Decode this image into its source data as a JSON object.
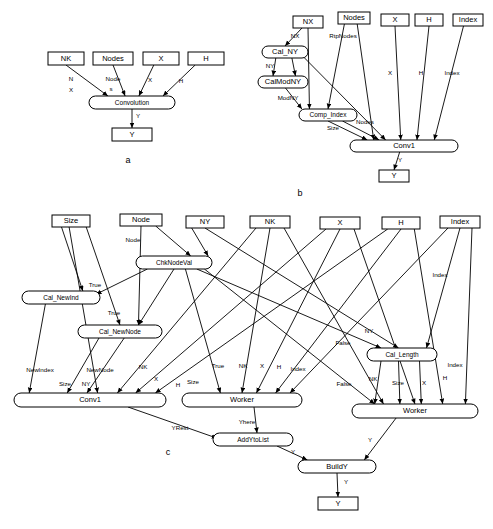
{
  "figure": {
    "panels": [
      {
        "id": "a",
        "letter": "a",
        "nodes": [
          {
            "name": "nk-box",
            "label": "NK",
            "shape": "rect",
            "x": 48,
            "y": 52,
            "w": 36,
            "h": 13
          },
          {
            "name": "nodes-box",
            "label": "Nodes",
            "shape": "rect",
            "x": 93,
            "y": 52,
            "w": 40,
            "h": 13
          },
          {
            "name": "x-box",
            "label": "X",
            "shape": "rect",
            "x": 143,
            "y": 52,
            "w": 36,
            "h": 13
          },
          {
            "name": "h-box",
            "label": "H",
            "shape": "rect",
            "x": 188,
            "y": 52,
            "w": 36,
            "h": 13
          },
          {
            "name": "convolution-oval",
            "label": "Convolution",
            "shape": "oval",
            "x": 89,
            "y": 96,
            "w": 86,
            "h": 13
          },
          {
            "name": "y-box",
            "label": "Y",
            "shape": "rect",
            "x": 112,
            "y": 128,
            "w": 40,
            "h": 13
          }
        ],
        "edge_labels": [
          {
            "text": "N",
            "x": 71,
            "y": 79
          },
          {
            "text": "X",
            "x": 71,
            "y": 90
          },
          {
            "text": "Node",
            "x": 113,
            "y": 79
          },
          {
            "text": "s",
            "x": 111,
            "y": 89
          },
          {
            "text": "X",
            "x": 150,
            "y": 80
          },
          {
            "text": "H",
            "x": 181,
            "y": 81
          },
          {
            "text": "Y",
            "x": 138,
            "y": 116
          }
        ]
      },
      {
        "id": "b",
        "letter": "b",
        "nodes": [
          {
            "name": "nx-box",
            "label": "NX",
            "shape": "rect",
            "x": 293,
            "y": 16,
            "w": 30,
            "h": 12
          },
          {
            "name": "nodes-box",
            "label": "Nodes",
            "shape": "rect",
            "x": 338,
            "y": 12,
            "w": 32,
            "h": 12
          },
          {
            "name": "x-box",
            "label": "X",
            "shape": "rect",
            "x": 381,
            "y": 14,
            "w": 28,
            "h": 12
          },
          {
            "name": "h-box",
            "label": "H",
            "shape": "rect",
            "x": 415,
            "y": 14,
            "w": 28,
            "h": 12
          },
          {
            "name": "index-box",
            "label": "Index",
            "shape": "rect",
            "x": 453,
            "y": 14,
            "w": 30,
            "h": 12
          },
          {
            "name": "cal-ny-oval",
            "label": "Cal_NY",
            "shape": "oval",
            "x": 262,
            "y": 46,
            "w": 46,
            "h": 12
          },
          {
            "name": "calmodny-oval",
            "label": "CalModNY",
            "shape": "oval",
            "x": 258,
            "y": 76,
            "w": 50,
            "h": 12
          },
          {
            "name": "comp-index-oval",
            "label": "Comp_Index",
            "shape": "oval",
            "x": 299,
            "y": 109,
            "w": 58,
            "h": 12
          },
          {
            "name": "conv1-oval",
            "label": "Conv1",
            "shape": "oval",
            "x": 350,
            "y": 140,
            "w": 108,
            "h": 12
          },
          {
            "name": "y-box",
            "label": "Y",
            "shape": "rect",
            "x": 379,
            "y": 170,
            "w": 30,
            "h": 12
          }
        ],
        "edge_labels": [
          {
            "text": "NX",
            "x": 295,
            "y": 36
          },
          {
            "text": "RtpNodes",
            "x": 343,
            "y": 36
          },
          {
            "text": "NY",
            "x": 270,
            "y": 66
          },
          {
            "text": "ModNY",
            "x": 288,
            "y": 98
          },
          {
            "text": "Size",
            "x": 333,
            "y": 128
          },
          {
            "text": "Nodes",
            "x": 365,
            "y": 122
          },
          {
            "text": "X",
            "x": 390,
            "y": 73
          },
          {
            "text": "H",
            "x": 421,
            "y": 73
          },
          {
            "text": "Index",
            "x": 452,
            "y": 73
          },
          {
            "text": "Y",
            "x": 400,
            "y": 160
          }
        ]
      },
      {
        "id": "c",
        "letter": "c",
        "nodes": [
          {
            "name": "size-box",
            "label": "Size",
            "shape": "rect",
            "x": 52,
            "y": 215,
            "w": 38,
            "h": 12
          },
          {
            "name": "node-box",
            "label": "Node",
            "shape": "rect",
            "x": 120,
            "y": 214,
            "w": 42,
            "h": 12
          },
          {
            "name": "ny-box",
            "label": "NY",
            "shape": "rect",
            "x": 186,
            "y": 216,
            "w": 38,
            "h": 12
          },
          {
            "name": "nk-box",
            "label": "NK",
            "shape": "rect",
            "x": 250,
            "y": 216,
            "w": 40,
            "h": 12
          },
          {
            "name": "x-box",
            "label": "X",
            "shape": "rect",
            "x": 320,
            "y": 217,
            "w": 40,
            "h": 12
          },
          {
            "name": "h-box",
            "label": "H",
            "shape": "rect",
            "x": 382,
            "y": 217,
            "w": 38,
            "h": 12
          },
          {
            "name": "index-box",
            "label": "Index",
            "shape": "rect",
            "x": 440,
            "y": 216,
            "w": 40,
            "h": 12
          },
          {
            "name": "chknodeval-oval",
            "label": "ChkNodeVal",
            "shape": "oval",
            "x": 136,
            "y": 256,
            "w": 76,
            "h": 13
          },
          {
            "name": "cal-newind-oval",
            "label": "Cal_NewInd",
            "shape": "oval",
            "x": 22,
            "y": 291,
            "w": 78,
            "h": 13
          },
          {
            "name": "cal-newnode-oval",
            "label": "Cal_NewNode",
            "shape": "oval",
            "x": 78,
            "y": 325,
            "w": 84,
            "h": 13
          },
          {
            "name": "cal-length-oval",
            "label": "Cal_Length",
            "shape": "oval",
            "x": 367,
            "y": 348,
            "w": 70,
            "h": 13
          },
          {
            "name": "conv1-oval",
            "label": "Conv1",
            "shape": "oval",
            "x": 14,
            "y": 393,
            "w": 152,
            "h": 14
          },
          {
            "name": "worker-left-oval",
            "label": "Worker",
            "shape": "oval",
            "x": 182,
            "y": 393,
            "w": 120,
            "h": 14
          },
          {
            "name": "worker-right-oval",
            "label": "Worker",
            "shape": "oval",
            "x": 352,
            "y": 404,
            "w": 126,
            "h": 14
          },
          {
            "name": "addytolist-oval",
            "label": "AddYtoList",
            "shape": "oval",
            "x": 213,
            "y": 433,
            "w": 80,
            "h": 13
          },
          {
            "name": "buildy-oval",
            "label": "BuildY",
            "shape": "oval",
            "x": 298,
            "y": 460,
            "w": 78,
            "h": 13
          },
          {
            "name": "y-box",
            "label": "Y",
            "shape": "rect",
            "x": 318,
            "y": 497,
            "w": 40,
            "h": 13
          }
        ],
        "edge_labels": [
          {
            "text": "Node",
            "x": 133,
            "y": 240
          },
          {
            "text": "True",
            "x": 95,
            "y": 285
          },
          {
            "text": "True",
            "x": 114,
            "y": 313
          },
          {
            "text": "NewIndex",
            "x": 40,
            "y": 370
          },
          {
            "text": "NewNode",
            "x": 100,
            "y": 370
          },
          {
            "text": "Size",
            "x": 65,
            "y": 384
          },
          {
            "text": "NY",
            "x": 86,
            "y": 384
          },
          {
            "text": "NK",
            "x": 143,
            "y": 367
          },
          {
            "text": "X",
            "x": 156,
            "y": 379
          },
          {
            "text": "H",
            "x": 178,
            "y": 385
          },
          {
            "text": "Size",
            "x": 193,
            "y": 382
          },
          {
            "text": "True",
            "x": 218,
            "y": 366
          },
          {
            "text": "NK",
            "x": 243,
            "y": 366
          },
          {
            "text": "X",
            "x": 262,
            "y": 366
          },
          {
            "text": "H",
            "x": 279,
            "y": 367
          },
          {
            "text": "Index",
            "x": 298,
            "y": 369
          },
          {
            "text": "NY",
            "x": 369,
            "y": 331
          },
          {
            "text": "False",
            "x": 343,
            "y": 343
          },
          {
            "text": "False",
            "x": 344,
            "y": 384
          },
          {
            "text": "Index",
            "x": 440,
            "y": 275
          },
          {
            "text": "Index",
            "x": 455,
            "y": 365
          },
          {
            "text": "NK",
            "x": 373,
            "y": 379
          },
          {
            "text": "Size",
            "x": 398,
            "y": 383
          },
          {
            "text": "X",
            "x": 424,
            "y": 383
          },
          {
            "text": "H",
            "x": 445,
            "y": 378
          },
          {
            "text": "Yhere",
            "x": 247,
            "y": 422
          },
          {
            "text": "YRest",
            "x": 180,
            "y": 428
          },
          {
            "text": "Y",
            "x": 293,
            "y": 452
          },
          {
            "text": "Y",
            "x": 370,
            "y": 440
          },
          {
            "text": "Y",
            "x": 346,
            "y": 482
          }
        ]
      }
    ],
    "colors": {
      "stroke": "#000000",
      "fill": "#ffffff",
      "text": "#000000"
    }
  }
}
